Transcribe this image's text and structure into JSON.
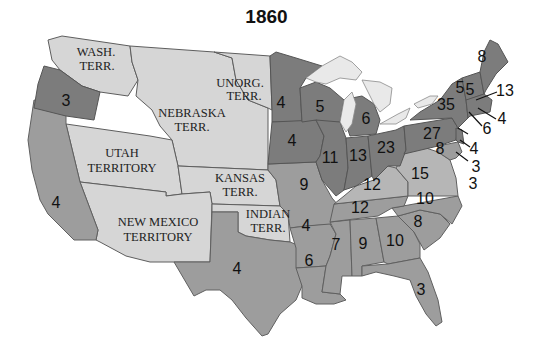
{
  "title": "1860",
  "colors": {
    "free_state": "#7c7c7c",
    "slave_state": "#9d9d9d",
    "border_state": "#b6b6b6",
    "territory": "#d6d6d6",
    "lake": "#e9e9e9"
  },
  "territories": [
    {
      "name": "wash-terr",
      "line1": "WASH.",
      "line2": "TERR."
    },
    {
      "name": "nebraska-terr",
      "line1": "NEBRASKA",
      "line2": "TERR."
    },
    {
      "name": "unorg-terr",
      "line1": "UNORG.",
      "line2": "TERR."
    },
    {
      "name": "utah-territory",
      "line1": "UTAH",
      "line2": "TERRITORY"
    },
    {
      "name": "kansas-terr",
      "line1": "KANSAS",
      "line2": "TERR."
    },
    {
      "name": "new-mexico-territory",
      "line1": "NEW MEXICO",
      "line2": "TERRITORY"
    },
    {
      "name": "indian-terr",
      "line1": "INDIAN",
      "line2": "TERR."
    }
  ],
  "states": {
    "oregon": "3",
    "california": "4",
    "minnesota": "4",
    "iowa": "4",
    "wisconsin": "5",
    "michigan": "6",
    "illinois": "11",
    "indiana": "13",
    "ohio": "23",
    "pennsylvania": "27",
    "new_york": "35",
    "vermont": "5",
    "new_hampshire": "5",
    "maine": "8",
    "massachusetts": "13",
    "rhode_island": "4",
    "connecticut": "6",
    "new_jersey": "4",
    "delaware": "3",
    "maryland_east": "3",
    "maryland": "8",
    "missouri": "9",
    "kentucky": "12",
    "virginia": "15",
    "tennessee": "12",
    "north_carolina": "10",
    "south_carolina": "8",
    "georgia": "10",
    "alabama": "9",
    "mississippi": "7",
    "louisiana": "6",
    "arkansas": "4",
    "texas": "4",
    "florida": "3"
  }
}
